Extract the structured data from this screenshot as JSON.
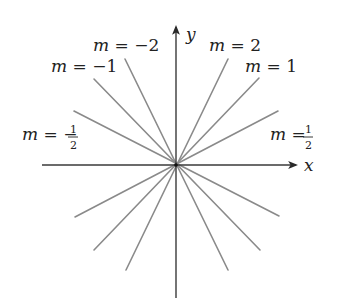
{
  "diagram": {
    "title": "",
    "axes": {
      "x_label": "x",
      "y_label": "y",
      "origin": [
        176,
        165
      ]
    },
    "lines": [
      {
        "slope": "2",
        "label_var": "m",
        "label_eq": " = ",
        "label_val": "2"
      },
      {
        "slope": "1",
        "label_var": "m",
        "label_eq": " = ",
        "label_val": "1"
      },
      {
        "slope": "1/2",
        "label_var": "m",
        "label_eq": " = ",
        "label_num": "1",
        "label_den": "2"
      },
      {
        "slope": "-2",
        "label_var": "m",
        "label_eq": " = ",
        "label_val": "−2"
      },
      {
        "slope": "-1",
        "label_var": "m",
        "label_eq": " = ",
        "label_val": "−1"
      },
      {
        "slope": "-1/2",
        "label_var": "m",
        "label_eq": " = −",
        "label_num": "1",
        "label_den": "2"
      }
    ],
    "colors": {
      "axis": "#3a3a3a",
      "lines": "#8a8a8a",
      "text": "#222222",
      "background": "#ffffff"
    }
  }
}
